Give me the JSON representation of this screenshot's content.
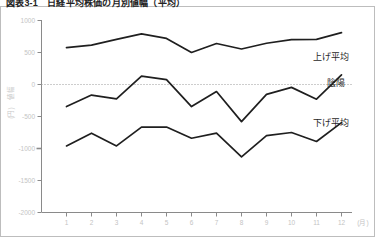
{
  "chart_title": "図表3-1　日経平均株価の月別値幅（平均）",
  "axis": {
    "y_title_line1": "値幅",
    "y_title_line2": "(円)",
    "x_unit": "(月)",
    "y_ticks": [
      "1000",
      "500",
      "0",
      "-500",
      "-1000",
      "-1500",
      "-2000"
    ],
    "x_ticks": [
      "1",
      "2",
      "3",
      "4",
      "5",
      "6",
      "7",
      "8",
      "9",
      "10",
      "11",
      "12"
    ]
  },
  "series_labels": {
    "up": "上げ平均",
    "balance": "陰陽",
    "down": "下げ平均"
  },
  "colors": {
    "line": "#1f1f1f",
    "axis": "#8a8a8a",
    "tick_text": "#c4c4c4",
    "border": "#bdbdbd",
    "background": "#ffffff"
  },
  "chart_data": {
    "type": "line",
    "title": "図表3-1　日経平均株価の月別値幅（平均）",
    "xlabel": "(月)",
    "ylabel": "値幅 (円)",
    "categories": [
      "1",
      "2",
      "3",
      "4",
      "5",
      "6",
      "7",
      "8",
      "9",
      "10",
      "11",
      "12"
    ],
    "ylim": [
      -2000,
      1000
    ],
    "xlim": [
      1,
      12
    ],
    "grid": false,
    "zero_line": true,
    "legend": "inline-right",
    "series": [
      {
        "name": "上げ平均",
        "values": [
          575,
          615,
          705,
          790,
          720,
          500,
          640,
          555,
          645,
          700,
          705,
          810
        ]
      },
      {
        "name": "陰陽",
        "values": [
          -345,
          -165,
          -225,
          130,
          75,
          -345,
          -110,
          -580,
          -155,
          -45,
          -230,
          150
        ]
      },
      {
        "name": "下げ平均",
        "values": [
          -960,
          -760,
          -960,
          -665,
          -665,
          -840,
          -760,
          -1130,
          -800,
          -750,
          -890,
          -595
        ]
      }
    ]
  }
}
